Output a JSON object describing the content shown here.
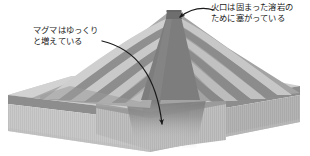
{
  "figure": {
    "background_color": "#ffffff",
    "width": 310,
    "height": 156
  },
  "annotations": [
    {
      "id": "crater-annotation",
      "lines": [
        "火口は固まった溶岩の",
        "ために塞がっている"
      ],
      "line1": "火口は固まった溶岩の",
      "line2": "ために塞がっている",
      "arrow_name": "crater-arrow",
      "arrow_target": "crater-summit",
      "color": "#1a1a1a"
    },
    {
      "id": "magma-annotation",
      "lines": [
        "マグマはゆっくり",
        "と増えている"
      ],
      "line1": "マグマはゆっくり",
      "line2": "と増えている",
      "arrow_name": "magma-arrow",
      "arrow_target": "magma-chamber",
      "color": "#1a1a1a"
    }
  ],
  "diagram": {
    "type": "stratovolcano-cutaway-block",
    "parts": [
      {
        "name": "ground-top-surface",
        "color": "#c8c8c8"
      },
      {
        "name": "ground-dark-stratum",
        "color": "#8a8a8a"
      },
      {
        "name": "ground-front-face",
        "color": "#c4c4c4"
      },
      {
        "name": "ground-side-face",
        "color": "#b0b0b0"
      },
      {
        "name": "volcano-cone-light-layer",
        "color": "#b9b9b9"
      },
      {
        "name": "volcano-cone-dark-layer",
        "color": "#8d8d8d"
      },
      {
        "name": "volcano-cone-shadow-flank",
        "color": "#9a9a9a"
      },
      {
        "name": "magma-conduit",
        "color": "#7a7a7a"
      },
      {
        "name": "magma-chamber",
        "color": "#8a8a8a"
      },
      {
        "name": "crater-plug",
        "color": "#6f6f6f"
      }
    ],
    "palette": {
      "line": "#1a1a1a",
      "lightest": "#d6d6d6",
      "light": "#c8c8c8",
      "mid": "#b0b0b0",
      "dark": "#8a8a8a",
      "darkest": "#6f6f6f"
    }
  }
}
